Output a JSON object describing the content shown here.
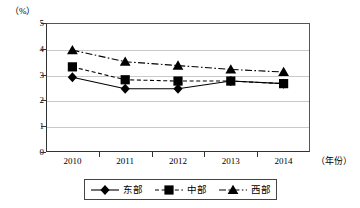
{
  "chart_data": {
    "type": "line",
    "title": "",
    "xlabel": "（年份）",
    "ylabel": "（%）",
    "categories": [
      "2010",
      "2011",
      "2012",
      "2013",
      "2014"
    ],
    "ylim": [
      0,
      5
    ],
    "yticks": [
      "0",
      "1",
      "2",
      "3",
      "4",
      "5"
    ],
    "grid": true,
    "legend_position": "bottom",
    "series": [
      {
        "name": "东部",
        "marker": "diamond",
        "line_style": "solid",
        "color": "#000000",
        "values": [
          2.9,
          2.45,
          2.45,
          2.75,
          2.65
        ]
      },
      {
        "name": "中部",
        "marker": "square",
        "line_style": "dotted",
        "color": "#000000",
        "values": [
          3.3,
          2.8,
          2.75,
          2.75,
          2.65
        ]
      },
      {
        "name": "西部",
        "marker": "triangle",
        "line_style": "dash-dot",
        "color": "#000000",
        "values": [
          3.95,
          3.5,
          3.35,
          3.2,
          3.1
        ]
      }
    ]
  }
}
